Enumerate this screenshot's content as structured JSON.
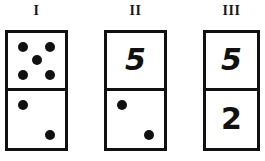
{
  "figure": {
    "type": "domino-comparison-diagram",
    "background_color": "#ffffff",
    "ink_color": "#111111",
    "width": 265,
    "height": 161
  },
  "dominoes": [
    {
      "label": "I",
      "label_x": 35,
      "tile": {
        "x": 5,
        "y": 30,
        "width": 63,
        "height": 121
      },
      "top": {
        "mode": "pips",
        "value": 5,
        "pips": [
          {
            "cx": 27,
            "cy": 25,
            "r": 5
          },
          {
            "cx": 73,
            "cy": 25,
            "r": 5
          },
          {
            "cx": 50,
            "cy": 50,
            "r": 5
          },
          {
            "cx": 27,
            "cy": 77,
            "r": 5
          },
          {
            "cx": 73,
            "cy": 77,
            "r": 5
          }
        ]
      },
      "bottom": {
        "mode": "pips",
        "value": 2,
        "pips": [
          {
            "cx": 27,
            "cy": 25,
            "r": 5
          },
          {
            "cx": 73,
            "cy": 77,
            "r": 5
          }
        ]
      }
    },
    {
      "label": "II",
      "label_x": 133,
      "tile": {
        "x": 104,
        "y": 30,
        "width": 63,
        "height": 121
      },
      "top": {
        "mode": "numeral",
        "value": "5",
        "font_size": 30,
        "slanted": true
      },
      "bottom": {
        "mode": "pips",
        "value": 2,
        "pips": [
          {
            "cx": 27,
            "cy": 25,
            "r": 5
          },
          {
            "cx": 73,
            "cy": 77,
            "r": 5
          }
        ]
      }
    },
    {
      "label": "III",
      "label_x": 231,
      "tile": {
        "x": 203,
        "y": 30,
        "width": 57,
        "height": 121
      },
      "top": {
        "mode": "numeral",
        "value": "5",
        "font_size": 30,
        "slanted": true
      },
      "bottom": {
        "mode": "numeral",
        "value": "2",
        "font_size": 30,
        "slanted": false
      }
    }
  ]
}
